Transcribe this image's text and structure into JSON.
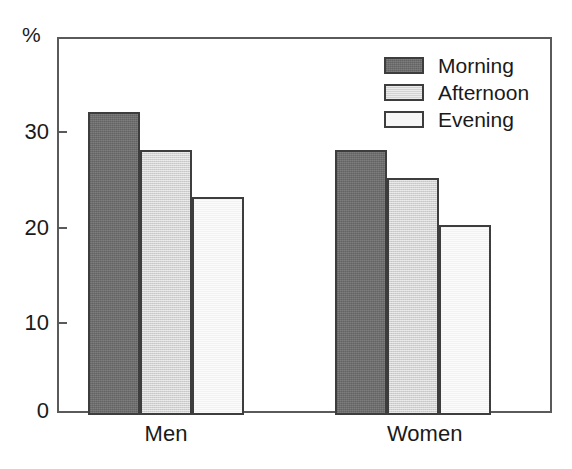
{
  "chart_data": {
    "type": "bar",
    "title": "",
    "xlabel": "",
    "ylabel": "%",
    "ylim": [
      0,
      38
    ],
    "yticks": [
      0,
      10,
      20,
      30
    ],
    "ytick_labels": [
      "0",
      "10",
      "20",
      "30"
    ],
    "grid": false,
    "legend_position": "upper right",
    "categories": [
      "Men",
      "Women"
    ],
    "series": [
      {
        "name": "Morning",
        "values": [
          32,
          28
        ],
        "color": "#6e6e6e"
      },
      {
        "name": "Afternoon",
        "values": [
          28,
          25
        ],
        "color": "#d2d2d2"
      },
      {
        "name": "Evening",
        "values": [
          23,
          20
        ],
        "color": "#f2f2f2"
      }
    ]
  },
  "axis": {
    "unit_label": "%",
    "tick_labels": [
      "30",
      "20",
      "10",
      "0"
    ]
  },
  "legend": {
    "items": [
      {
        "label": "Morning"
      },
      {
        "label": "Afternoon"
      },
      {
        "label": "Evening"
      }
    ]
  },
  "categories": [
    {
      "label": "Men"
    },
    {
      "label": "Women"
    }
  ],
  "colors": {
    "morning": "#6e6e6e",
    "afternoon": "#d2d2d2",
    "evening": "#f2f2f2",
    "outline": "#3d3d3d",
    "frame": "#5a5a5a",
    "background": "#ffffff"
  }
}
